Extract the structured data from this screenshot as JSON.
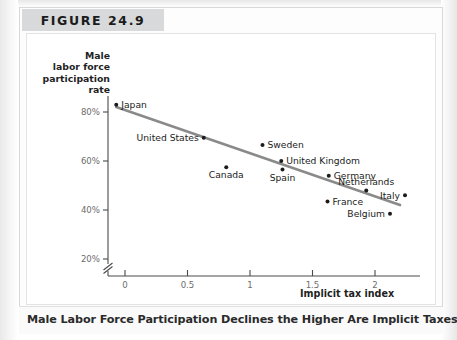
{
  "figure": {
    "tag": "FIGURE 24.9",
    "caption": "Male Labor Force Participation Declines the Higher Are Implicit Taxes"
  },
  "chart_data": {
    "type": "scatter",
    "title": "Male Labor Force Participation Declines the Higher Are Implicit Taxes",
    "xlabel": "Implicit tax index",
    "ylabel": "Male labor force participation rate",
    "ylabel_lines": [
      "Male",
      "labor force",
      "participation",
      "rate"
    ],
    "xlim": [
      -0.25,
      2.3
    ],
    "ylim": [
      15,
      92
    ],
    "xticks": [
      0,
      0.5,
      1,
      1.5,
      2
    ],
    "xticklabels": [
      "0",
      "0.5",
      "1",
      "1.5",
      "2"
    ],
    "yticks": [
      20,
      40,
      60,
      80
    ],
    "yticklabels": [
      "20%",
      "40%",
      "60%",
      "80%"
    ],
    "y_axis_break": true,
    "grid": false,
    "legend": "none",
    "point_color": "#1c1c1c",
    "trendline_color": "#8a8a8a",
    "points": [
      {
        "label": "Japan",
        "x": -0.07,
        "y": 83.0,
        "label_pos": "right"
      },
      {
        "label": "United States",
        "x": 0.63,
        "y": 69.5,
        "label_pos": "left"
      },
      {
        "label": "Sweden",
        "x": 1.1,
        "y": 66.5,
        "label_pos": "right"
      },
      {
        "label": "United Kingdom",
        "x": 1.25,
        "y": 60.0,
        "label_pos": "right"
      },
      {
        "label": "Canada",
        "x": 0.81,
        "y": 57.5,
        "label_pos": "below"
      },
      {
        "label": "Spain",
        "x": 1.26,
        "y": 56.5,
        "label_pos": "below"
      },
      {
        "label": "Germany",
        "x": 1.63,
        "y": 54.0,
        "label_pos": "right"
      },
      {
        "label": "Netherlands",
        "x": 1.93,
        "y": 48.0,
        "label_pos": "above"
      },
      {
        "label": "Italy",
        "x": 2.24,
        "y": 46.0,
        "label_pos": "left"
      },
      {
        "label": "France",
        "x": 1.62,
        "y": 43.5,
        "label_pos": "right"
      },
      {
        "label": "Belgium",
        "x": 2.12,
        "y": 38.5,
        "label_pos": "left"
      }
    ],
    "trendline": {
      "x0": -0.07,
      "y0": 82.0,
      "x1": 2.2,
      "y1": 42.0
    }
  }
}
